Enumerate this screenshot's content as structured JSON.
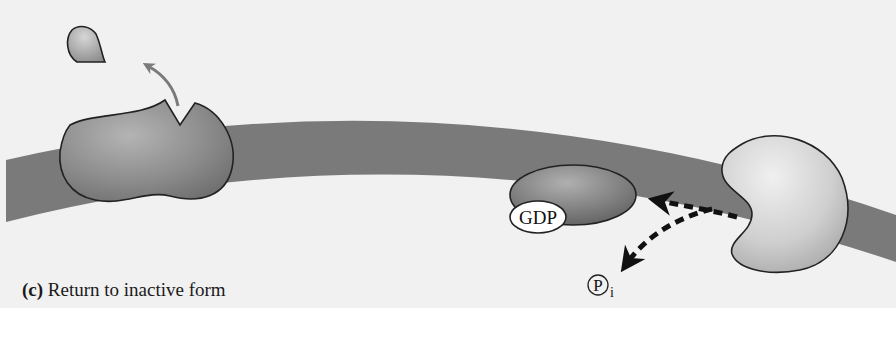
{
  "figure": {
    "panel_letter": "(c)",
    "caption": "Return to inactive form",
    "colors": {
      "background": "#f1f1f1",
      "membrane": "#7a7a7a",
      "receptor": "#8a8a8a",
      "g_protein": "#7c7c7c",
      "enzyme": "#c8c8c8",
      "ligand": "#a8a8a8",
      "outline": "#222222",
      "dashed_arrow": "#111111",
      "curved_arrow": "#7a7a7a"
    }
  },
  "labels": {
    "gdp": "GDP",
    "phosphate_symbol": "P",
    "phosphate_subscript": "i"
  },
  "elements": {
    "ligand": "ligand leaving receptor",
    "receptor": "membrane receptor (inactive)",
    "g_protein": "G protein bound to GDP",
    "effector": "effector enzyme",
    "arrows": [
      "ligand release arrow",
      "hydrolysis arrow to G protein",
      "phosphate release arrow"
    ]
  }
}
